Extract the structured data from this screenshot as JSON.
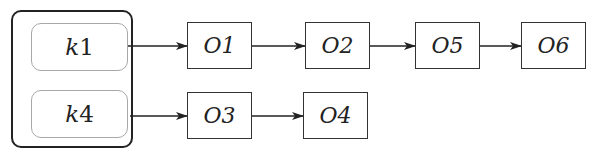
{
  "diagram": {
    "type": "hash-table-chaining",
    "keys": [
      {
        "var": "k",
        "num": "1"
      },
      {
        "var": "k",
        "num": "4"
      }
    ],
    "chains": [
      {
        "key": "k1",
        "objects": [
          "O1",
          "O2",
          "O5",
          "O6"
        ]
      },
      {
        "key": "k4",
        "objects": [
          "O3",
          "O4"
        ]
      }
    ],
    "objects": {
      "O1": "O1",
      "O2": "O2",
      "O5": "O5",
      "O6": "O6",
      "O3": "O3",
      "O4": "O4"
    },
    "colors": {
      "stroke": "#222222",
      "key_border": "#a8a8a8",
      "background": "#ffffff"
    }
  }
}
